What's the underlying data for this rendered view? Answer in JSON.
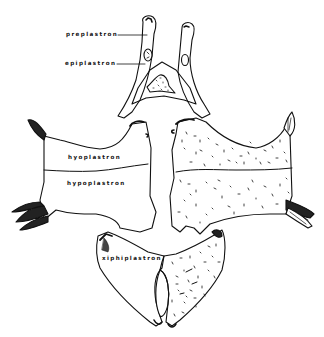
{
  "figure": {
    "background": "#ffffff",
    "ink_color": "#111111",
    "labels": [
      {
        "id": "preplastron",
        "text": "preplastron"
      },
      {
        "id": "epiplastron",
        "text": "epiplastron"
      },
      {
        "id": "hyoplastron",
        "text": "hyoplastron"
      },
      {
        "id": "hypoplastron",
        "text": "hypoplastron"
      },
      {
        "id": "xiphiplastron",
        "text": "xiphiplastron"
      }
    ]
  }
}
